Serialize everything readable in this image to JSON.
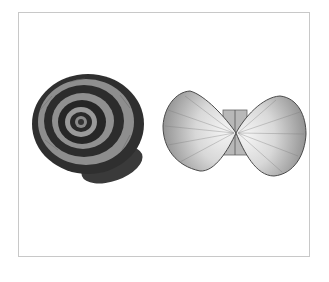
{
  "image": {
    "description": "Engraved illustration of a spiral snail shell beside an opened bivalve scallop shell, inside a thin grey frame",
    "subjects": [
      {
        "name": "snail-shell",
        "type": "spiral gastropod shell",
        "bands": "alternating dark and light spiral bands"
      },
      {
        "name": "scallop-shell",
        "type": "opened bivalve (two valves joined at hinge)",
        "texture": "radial ribs, light center"
      }
    ],
    "colors": {
      "background": "#ffffff",
      "frame": "#c8c8c8",
      "dark_band": "#2e2e2e",
      "light_band": "#8a8a8a",
      "scallop_light": "#e8e8e8",
      "scallop_mid": "#a0a0a0",
      "scallop_edge": "#555555"
    }
  }
}
